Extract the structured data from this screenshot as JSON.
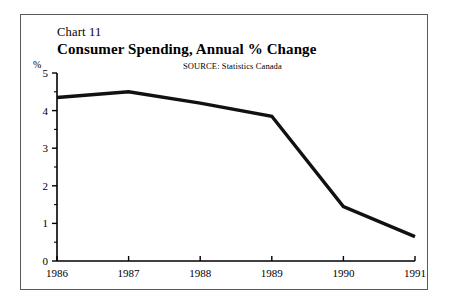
{
  "figure": {
    "chart_number": "Chart 11",
    "title": "Consumer Spending, Annual % Change",
    "source": "SOURCE:  Statistics Canada",
    "y_unit_label": "%",
    "border_color": "#5a5a5a",
    "line_color": "#111111",
    "background": "#ffffff"
  },
  "chart_data": {
    "type": "line",
    "title": "Consumer Spending, Annual % Change",
    "subtitle": "Chart 11",
    "annotations": [
      "SOURCE:  Statistics Canada"
    ],
    "xlabel": "",
    "ylabel": "%",
    "categories": [
      "1986",
      "1987",
      "1988",
      "1989",
      "1990",
      "1991"
    ],
    "x": [
      1986,
      1987,
      1988,
      1989,
      1990,
      1991
    ],
    "values": [
      4.35,
      4.5,
      4.2,
      3.85,
      1.45,
      0.65
    ],
    "series": [
      {
        "name": "Consumer Spending, Annual % Change",
        "values": [
          4.35,
          4.5,
          4.2,
          3.85,
          1.45,
          0.65
        ]
      }
    ],
    "ylim": [
      0,
      5
    ],
    "xlim": [
      1986,
      1991
    ],
    "y_ticks": [
      0,
      1,
      2,
      3,
      4,
      5
    ],
    "y_tick_labels": [
      "0",
      "1",
      "2",
      "3",
      "4",
      "5"
    ],
    "y_minor_ticks": [
      0.5,
      1.5,
      2.5,
      3.5,
      4.5
    ],
    "x_ticks": [
      1986,
      1987,
      1988,
      1989,
      1990,
      1991
    ],
    "x_tick_labels": [
      "1986",
      "1987",
      "1988",
      "1989",
      "1990",
      "1991"
    ],
    "grid": false,
    "legend": false,
    "legend_position": "none"
  }
}
